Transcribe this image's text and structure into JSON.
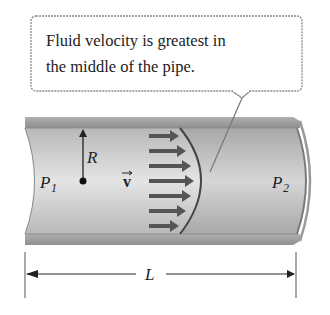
{
  "callout": {
    "line1": "Fluid velocity is greatest in",
    "line2": "the middle of the pipe."
  },
  "labels": {
    "radius": "R",
    "pressure_in_base": "P",
    "pressure_in_sub": "1",
    "pressure_out_base": "P",
    "pressure_out_sub": "2",
    "velocity": "v",
    "length": "L"
  },
  "colors": {
    "pipe_wall": "#9a9a9a",
    "pipe_inner": "#c4c4c4",
    "arrows": "#555555",
    "text": "#222222"
  }
}
